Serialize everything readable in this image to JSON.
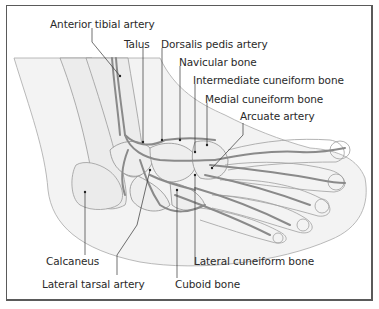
{
  "figure": {
    "colors": {
      "frame": "#5a5a5a",
      "artery": "#8a8a8a",
      "bone_outline": "#9a9a9a",
      "skin": "#f2f2f2",
      "text": "#2a2a2a",
      "leader": "#333333"
    }
  },
  "labels": [
    {
      "id": "anterior-tibial-artery",
      "text": "Anterior tibial artery"
    },
    {
      "id": "talus",
      "text": "Talus"
    },
    {
      "id": "dorsalis-pedis-artery",
      "text": "Dorsalis pedis artery"
    },
    {
      "id": "navicular-bone",
      "text": "Navicular bone"
    },
    {
      "id": "intermediate-cuneiform-bone",
      "text": "Intermediate cuneiform bone"
    },
    {
      "id": "medial-cuneiform-bone",
      "text": "Medial cuneiform bone"
    },
    {
      "id": "arcuate-artery",
      "text": "Arcuate artery"
    },
    {
      "id": "calcaneus",
      "text": "Calcaneus"
    },
    {
      "id": "lateral-cuneiform-bone",
      "text": "Lateral cuneiform bone"
    },
    {
      "id": "lateral-tarsal-artery",
      "text": "Lateral tarsal artery"
    },
    {
      "id": "cuboid-bone",
      "text": "Cuboid bone"
    }
  ]
}
